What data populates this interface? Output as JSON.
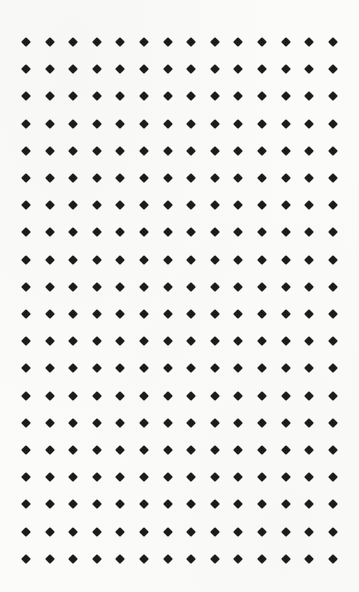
{
  "pattern": {
    "type": "diamond-dot-grid",
    "columns": 14,
    "rows": 20,
    "origin_x": 26,
    "origin_y": 42,
    "pitch_x": 23.6,
    "pitch_y": 27.2,
    "dot_size": 7,
    "dot_shape": "diamond",
    "dot_color": "#1c1c1c",
    "background_color": "#fbfbfa"
  }
}
